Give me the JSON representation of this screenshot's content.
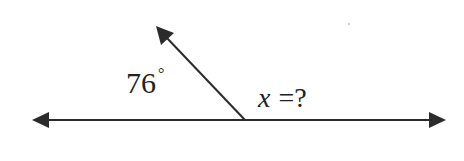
{
  "diagram": {
    "type": "supplementary-angles",
    "known_angle": {
      "value": "76",
      "unit_symbol": "°"
    },
    "unknown_angle": {
      "variable": "x",
      "relation": "=?"
    },
    "line_color": "#2b2b2b",
    "text_color": "#222222",
    "background": "#ffffff",
    "geometry": {
      "baseline_y": 120,
      "baseline_left_tip_x": 32,
      "baseline_right_tip_x": 446,
      "vertex": [
        245,
        120
      ],
      "ray_tip": [
        156,
        26
      ]
    }
  }
}
